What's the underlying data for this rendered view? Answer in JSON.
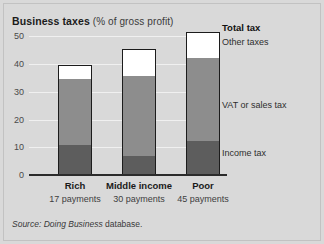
{
  "title": {
    "main": "Business taxes",
    "sub": " (% of gross profit)"
  },
  "source": {
    "italic": "Source: Doing Business",
    "plain": " database."
  },
  "annotations": {
    "total_tax": "Total tax",
    "other_taxes": "Other taxes",
    "vat": "VAT or sales tax",
    "income": "Income tax"
  },
  "axis": {
    "ticks": [
      "0",
      "10",
      "20",
      "30",
      "40",
      "50"
    ]
  },
  "colors": {
    "income_tax": "#5d5d5d",
    "vat_sales_tax": "#8d8d8d",
    "other_taxes": "#ffffff",
    "bar_outline": "#1c1c1c",
    "background": "#d9d9d9",
    "gridline": "#f0f0f0"
  },
  "chart_data": {
    "type": "bar",
    "subtype": "stacked",
    "title": "Business taxes (% of gross profit)",
    "xlabel": "",
    "ylabel": "% of gross profit",
    "ylim": [
      0,
      53
    ],
    "yticks": [
      0,
      10,
      20,
      30,
      40,
      50
    ],
    "grid": true,
    "legend": "right-side inline labels",
    "categories": [
      "Rich",
      "Middle income",
      "Poor"
    ],
    "category_sublabels": [
      "17 payments",
      "30 payments",
      "45 payments"
    ],
    "series": [
      {
        "name": "Income tax",
        "values": [
          11,
          7,
          12.5
        ]
      },
      {
        "name": "VAT or sales tax",
        "values": [
          24,
          29,
          30
        ]
      },
      {
        "name": "Other taxes",
        "values": [
          4.5,
          9.5,
          9
        ]
      }
    ],
    "totals": [
      39.5,
      45.5,
      51.5
    ],
    "total_label": "Total tax",
    "source": "Source: Doing Business database."
  }
}
